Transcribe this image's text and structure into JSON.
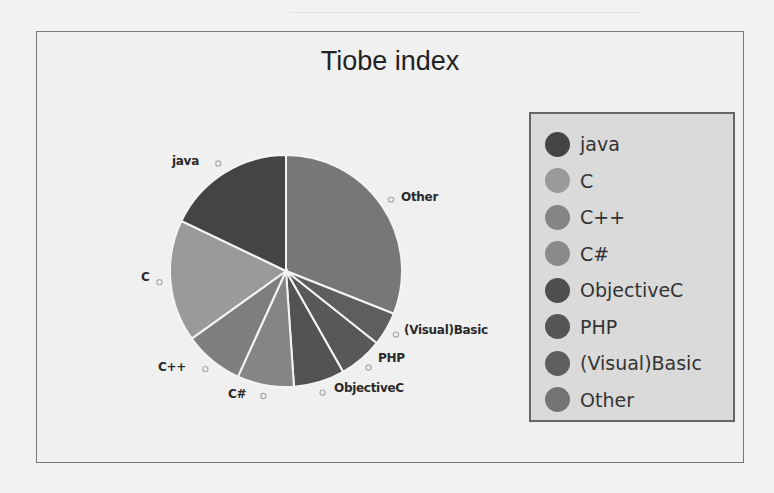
{
  "chart_data": {
    "type": "pie",
    "title": "Tiobe index",
    "start_angle_deg": 0,
    "direction": "clockwise",
    "slices": [
      {
        "label": "Other",
        "value": 31.0,
        "color": "#777777"
      },
      {
        "label": "(Visual)Basic",
        "value": 4.7,
        "color": "#5e5e5e"
      },
      {
        "label": "PHP",
        "value": 6.1,
        "color": "#585858"
      },
      {
        "label": "ObjectiveC",
        "value": 7.1,
        "color": "#525252"
      },
      {
        "label": "C#",
        "value": 7.9,
        "color": "#858585"
      },
      {
        "label": "C++",
        "value": 8.3,
        "color": "#7e7e7e"
      },
      {
        "label": "C",
        "value": 17.0,
        "color": "#9a9a9a"
      },
      {
        "label": "java",
        "value": 17.9,
        "color": "#444444"
      }
    ],
    "legend": {
      "position": "right",
      "entries": [
        "java",
        "C",
        "C++",
        "C#",
        "ObjectiveC",
        "PHP",
        "(Visual)Basic",
        "Other"
      ]
    },
    "grid": false
  },
  "chart": {
    "title": "Tiobe index"
  },
  "legend": {
    "items": [
      {
        "label": "java",
        "color": "#444444"
      },
      {
        "label": "C",
        "color": "#9a9a9a"
      },
      {
        "label": "C++",
        "color": "#858585"
      },
      {
        "label": "C#",
        "color": "#8a8a8a"
      },
      {
        "label": "ObjectiveC",
        "color": "#4e4e4e"
      },
      {
        "label": "PHP",
        "color": "#555555"
      },
      {
        "label": "(Visual)Basic",
        "color": "#5e5e5e"
      },
      {
        "label": "Other",
        "color": "#747474"
      }
    ]
  },
  "pie_labels": {
    "java": "java",
    "other": "Other",
    "c": "C",
    "visual_basic": "(Visual)Basic",
    "php": "PHP",
    "cpp": "C++",
    "csharp": "C#",
    "objective_c": "ObjectiveC"
  }
}
